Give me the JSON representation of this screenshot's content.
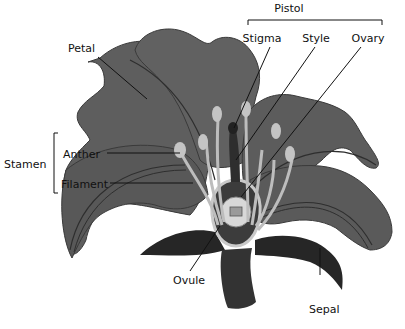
{
  "diagram": {
    "colors": {
      "petal": "#5e5e5e",
      "petal_edge": "#2e2e2e",
      "sepal": "#2a2a2a",
      "stem": "#333333",
      "stamen": "#bdbdbd",
      "ovary_ring": "#c9c9c9",
      "label_line": "#111111"
    },
    "labels": {
      "pistol": "Pistol",
      "stigma": "Stigma",
      "style": "Style",
      "ovary": "Ovary",
      "petal": "Petal",
      "stamen": "Stamen",
      "anther": "Anther",
      "filament": "Filament",
      "ovule": "Ovule",
      "sepal": "Sepal"
    }
  }
}
